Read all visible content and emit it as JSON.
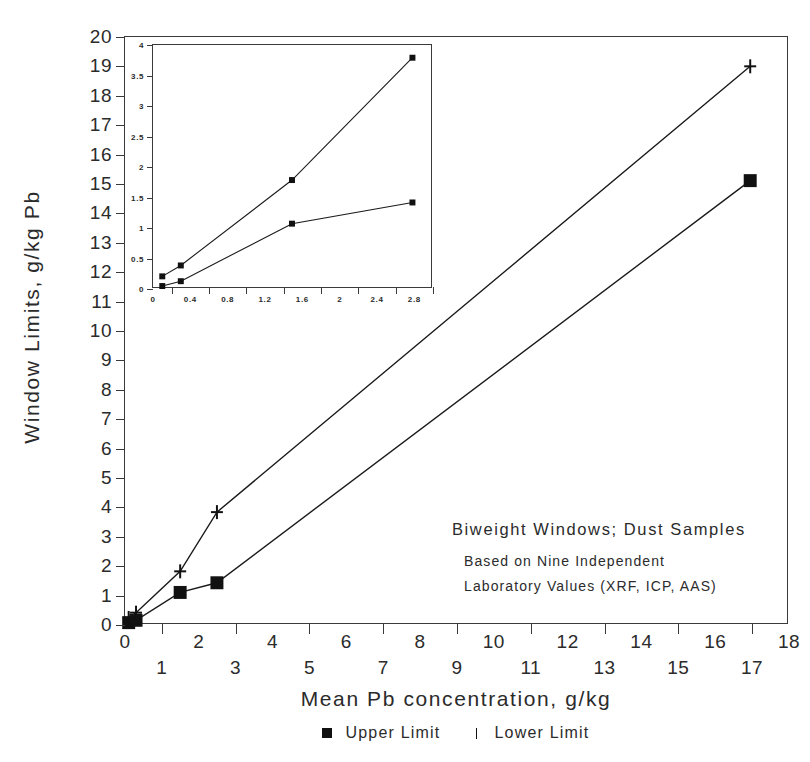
{
  "chart_data": {
    "type": "line",
    "title": "",
    "xlabel": "Mean Pb concentration, g/kg",
    "ylabel": "Window Limits, g/kg Pb",
    "xlim": [
      0,
      18
    ],
    "ylim": [
      0,
      20
    ],
    "grid": false,
    "legend_position": "bottom",
    "x_tick_labels": [
      "0",
      "1",
      "2",
      "3",
      "4",
      "5",
      "6",
      "7",
      "8",
      "9",
      "10",
      "11",
      "12",
      "13",
      "14",
      "15",
      "16",
      "17",
      "18"
    ],
    "y_tick_labels": [
      "0",
      "1",
      "2",
      "3",
      "4",
      "5",
      "6",
      "7",
      "8",
      "9",
      "10",
      "11",
      "12",
      "13",
      "14",
      "15",
      "16",
      "17",
      "18",
      "19",
      "20"
    ],
    "series": [
      {
        "name": "Upper Limit",
        "marker": "filled-square",
        "points": [
          {
            "x": 0.1,
            "y": 0.02
          },
          {
            "x": 0.3,
            "y": 0.1
          },
          {
            "x": 1.5,
            "y": 1.05
          },
          {
            "x": 2.5,
            "y": 1.38
          },
          {
            "x": 17.0,
            "y": 15.1
          }
        ]
      },
      {
        "name": "Lower Limit",
        "marker": "plus",
        "points": [
          {
            "x": 0.1,
            "y": 0.18
          },
          {
            "x": 0.3,
            "y": 0.36
          },
          {
            "x": 1.5,
            "y": 1.77
          },
          {
            "x": 2.5,
            "y": 3.79
          },
          {
            "x": 17.0,
            "y": 19.0
          }
        ]
      }
    ],
    "annotations": [
      "Biweight Windows; Dust Samples",
      "Based on Nine Independent",
      "Laboratory Values (XRF, ICP, AAS)"
    ],
    "inset": {
      "type": "line",
      "xlim": [
        0,
        3.0
      ],
      "ylim": [
        0,
        4
      ],
      "x_tick_labels": [
        "0",
        "0.4",
        "0.8",
        "1.2",
        "1.6",
        "2",
        "2.4",
        "2.8"
      ],
      "x_tick_values": [
        0,
        0.4,
        0.8,
        1.2,
        1.6,
        2.0,
        2.4,
        2.8
      ],
      "y_tick_labels": [
        "0",
        "0.5",
        "1",
        "1.5",
        "2",
        "2.5",
        "3",
        "3.5",
        "4"
      ],
      "y_tick_values": [
        0,
        0.5,
        1,
        1.5,
        2,
        2.5,
        3,
        3.5,
        4
      ],
      "series": [
        {
          "name": "Upper Limit",
          "marker": "filled-square",
          "points": [
            {
              "x": 0.1,
              "y": 0.02
            },
            {
              "x": 0.3,
              "y": 0.1
            },
            {
              "x": 1.5,
              "y": 1.05
            },
            {
              "x": 2.8,
              "y": 1.4
            }
          ]
        },
        {
          "name": "Lower Limit",
          "marker": "filled-square",
          "points": [
            {
              "x": 0.1,
              "y": 0.18
            },
            {
              "x": 0.3,
              "y": 0.36
            },
            {
              "x": 1.5,
              "y": 1.77
            },
            {
              "x": 2.8,
              "y": 3.79
            }
          ]
        }
      ]
    }
  },
  "legend": {
    "upper_label": "Upper Limit",
    "lower_label": "Lower Limit"
  },
  "colors": {
    "ink": "#1a1a1a",
    "axis": "#3a3a3a",
    "marker": "#111111",
    "background": "#ffffff"
  }
}
